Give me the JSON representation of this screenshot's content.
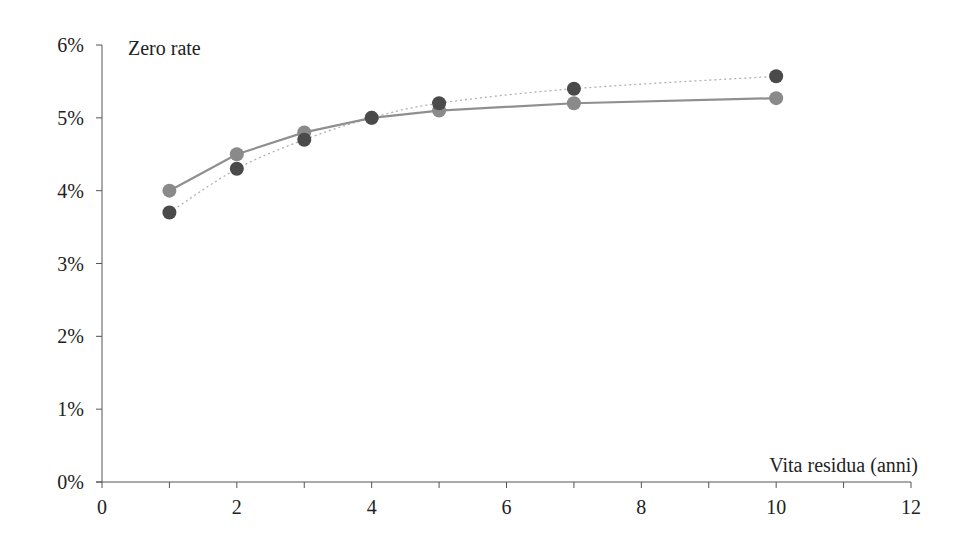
{
  "chart_data": {
    "type": "line",
    "title": "",
    "ylabel": "Zero rate",
    "xlabel": "Vita residua (anni)",
    "xlim": [
      0,
      12
    ],
    "ylim": [
      0,
      6
    ],
    "x_ticks": [
      "0",
      "2",
      "4",
      "6",
      "8",
      "10",
      "12"
    ],
    "y_ticks": [
      "0%",
      "1%",
      "2%",
      "3%",
      "4%",
      "5%",
      "6%"
    ],
    "grid": false,
    "legend": null,
    "x": [
      1,
      2,
      3,
      4,
      5,
      7,
      10
    ],
    "series": [
      {
        "name": "Curva 1 (linea continua, punti chiari)",
        "style": "solid",
        "color": "#8f8f8f",
        "marker_color": "#8a8a8a",
        "values": [
          4.0,
          4.5,
          4.8,
          5.0,
          5.1,
          5.2,
          5.27
        ]
      },
      {
        "name": "Curva 2 (linea punteggiata, punti scuri)",
        "style": "dotted",
        "color": "#b0b0b0",
        "marker_color": "#4a4a4a",
        "values": [
          3.7,
          4.3,
          4.7,
          5.0,
          5.2,
          5.4,
          5.57
        ]
      }
    ]
  }
}
